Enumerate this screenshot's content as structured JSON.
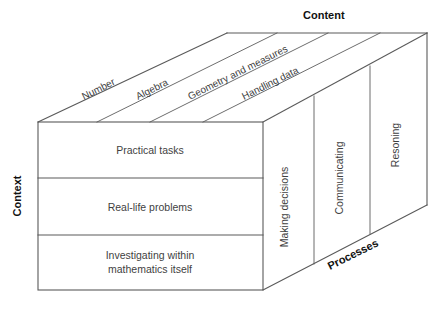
{
  "figure": {
    "type": "3d-cube-framework-diagram",
    "background_color": "#ffffff",
    "line_color": "#5a5a5a",
    "text_color": "#3f3f3f",
    "title_color": "#111111"
  },
  "axes": {
    "content": {
      "title": "Content",
      "orientation": "top-face",
      "categories": [
        "Number",
        "Algebra",
        "Geometry and measures",
        "Handling data"
      ]
    },
    "context": {
      "title": "Context",
      "orientation": "left-vertical",
      "categories": [
        "Practical tasks",
        "Real-life problems",
        "Investigating within mathematics itself"
      ]
    },
    "processes": {
      "title": "Processes",
      "orientation": "right-face",
      "categories": [
        "Making decisions",
        "Communicating",
        "Resoning"
      ]
    }
  },
  "front_rows": [
    {
      "line1": "Practical tasks",
      "line2": ""
    },
    {
      "line1": "Real-life problems",
      "line2": ""
    },
    {
      "line1": "Investigating within",
      "line2": "mathematics itself"
    }
  ]
}
